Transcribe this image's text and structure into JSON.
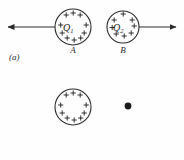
{
  "figure": {
    "background_color": "#fefefe",
    "ink_color": "#2b2b2b",
    "width": 184,
    "height": 160
  },
  "panels": [
    {
      "id": "a",
      "label": "(a)",
      "description": "Two positively charged spheres repelling each other",
      "spheres": [
        {
          "name": "sphere-a",
          "charge_symbol": "Q",
          "charge_subscript": "1",
          "label": "A",
          "cx": 73,
          "cy": 27,
          "r": 18,
          "plus_count": 10,
          "sign": "+"
        },
        {
          "name": "sphere-b",
          "charge_symbol": "Q",
          "charge_subscript": "2",
          "label": "B",
          "cx": 123,
          "cy": 27,
          "r": 16,
          "plus_count": 8,
          "sign": "+"
        }
      ],
      "force_arrows": [
        {
          "name": "force-arrow-left",
          "direction": "left",
          "x_start": 55,
          "x_end": 6,
          "y": 27
        },
        {
          "name": "force-arrow-right",
          "direction": "right",
          "x_start": 139,
          "x_end": 178,
          "y": 27
        }
      ]
    },
    {
      "id": "b",
      "label": "(b)",
      "description": "Single positively charged sphere and a test point charge at P",
      "spheres": [
        {
          "name": "sphere-a",
          "charge_symbol": "Q",
          "charge_subscript": "1",
          "label": "A",
          "cx": 73,
          "cy": 107,
          "r": 18,
          "plus_count": 10,
          "sign": "+"
        }
      ],
      "point_charge": {
        "name": "test-charge-q",
        "charge_label": "q",
        "point_label": "P",
        "cx": 128,
        "cy": 106,
        "r": 3.2
      }
    }
  ],
  "plus_marks": {
    "glyph": "+",
    "color": "#1f1f1f"
  }
}
